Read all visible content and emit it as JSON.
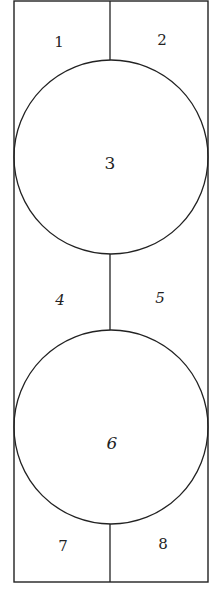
{
  "diagram": {
    "stroke_color": "#222222",
    "background": "#ffffff",
    "outer_rect": {
      "x": 14,
      "y": 1,
      "width": 194,
      "height": 581
    },
    "circles": [
      {
        "id": "circle-3",
        "cx": 111,
        "cy": 157,
        "r": 97,
        "label": "3"
      },
      {
        "id": "circle-6",
        "cx": 111,
        "cy": 427,
        "r": 97,
        "label": "6"
      }
    ],
    "dividers": [
      {
        "x": 110,
        "y1": 1,
        "y2": 60
      },
      {
        "x": 110,
        "y1": 254,
        "y2": 330
      },
      {
        "x": 110,
        "y1": 524,
        "y2": 582
      }
    ],
    "regions": [
      {
        "label": "1",
        "x": 59,
        "y": 42
      },
      {
        "label": "2",
        "x": 162,
        "y": 40
      },
      {
        "label": "3",
        "x": 110,
        "y": 163
      },
      {
        "label": "4",
        "x": 60,
        "y": 300
      },
      {
        "label": "5",
        "x": 160,
        "y": 298
      },
      {
        "label": "6",
        "x": 112,
        "y": 443
      },
      {
        "label": "7",
        "x": 63,
        "y": 546
      },
      {
        "label": "8",
        "x": 163,
        "y": 544
      }
    ]
  }
}
